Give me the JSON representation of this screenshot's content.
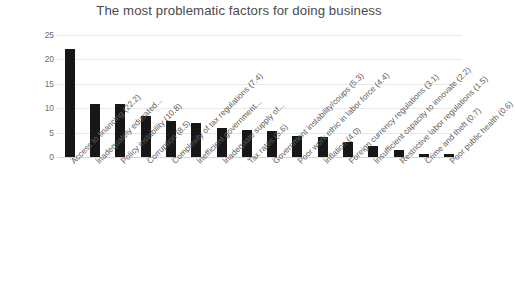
{
  "chart_data": {
    "type": "bar",
    "title": "The most problematic factors for doing business",
    "xlabel": "",
    "ylabel": "",
    "ylim": [
      0,
      25
    ],
    "yticks": [
      0,
      5,
      10,
      15,
      20,
      25
    ],
    "grid": true,
    "legend": false,
    "bar_color": "#171717",
    "grid_color": "#e8e8e8",
    "categories": [
      "Access to financing (22.2)",
      "Inadequately educated...",
      "Policy instability (10.8)",
      "Corruption (8.5)",
      "Complexity of tax regulations (7.4)",
      "Inefficient government...",
      "Inadequate supply of...",
      "Tax rates (5.6)",
      "Government instability/coups (5.3)",
      "Poor work ethic in labor force (4.4)",
      "Inflation (4.0)",
      "Foreign currency regulations (3.1)",
      "Insufficient capacity to innovate (2.2)",
      "Restrictive labor regulations (1.5)",
      "Crime and theft (0.7)",
      "Poor public health (0.6)"
    ],
    "values": [
      22.2,
      10.8,
      10.8,
      8.5,
      7.4,
      6.9,
      6.0,
      5.6,
      5.3,
      4.4,
      4.0,
      3.1,
      2.2,
      1.5,
      0.7,
      0.6
    ]
  }
}
